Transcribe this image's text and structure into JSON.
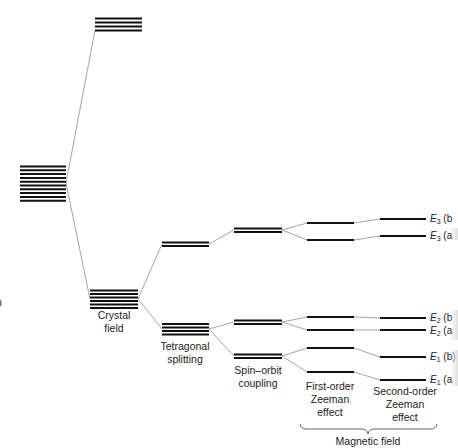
{
  "diagram": {
    "stage_labels": {
      "crystal_field": [
        "Crystal",
        "field"
      ],
      "tetragonal": [
        "Tetragonal",
        "splitting"
      ],
      "spin_orbit": [
        "Spin–orbit",
        "coupling"
      ],
      "first_zeeman": [
        "First-order",
        "Zeeman",
        "effect"
      ],
      "second_zeeman": [
        "Second-order",
        "Zeeman",
        "effect"
      ],
      "magnetic_field": "Magnetic field",
      "left_edge_fragment": "n"
    },
    "levels": [
      {
        "id": "E3b",
        "symbol": "E",
        "sub": "3",
        "suffix": " (b"
      },
      {
        "id": "E3a",
        "symbol": "E",
        "sub": "3",
        "suffix": " (a"
      },
      {
        "id": "E2b",
        "symbol": "E",
        "sub": "2",
        "suffix": " (b"
      },
      {
        "id": "E2a",
        "symbol": "E",
        "sub": "2",
        "suffix": " (a"
      },
      {
        "id": "E1b",
        "symbol": "E",
        "sub": "1",
        "suffix": " (b)"
      },
      {
        "id": "E1a",
        "symbol": "E",
        "sub": "1",
        "suffix": " (a"
      }
    ],
    "colors": {
      "line": "#111111",
      "connector": "#9a9a9a",
      "text": "#222222"
    }
  }
}
